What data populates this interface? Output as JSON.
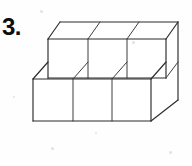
{
  "page": {
    "background_color": "#fefefe",
    "width": 192,
    "height": 166
  },
  "question": {
    "number_label": "3."
  },
  "figure": {
    "name": "cube-stack-figure",
    "line_color": "#2b2b2b",
    "face_color": "#ffffff",
    "cube_count_visible": 9,
    "rows": 2,
    "columns": 3,
    "projection": {
      "depth_dx": 14,
      "depth_dy": -17,
      "cube_width": 39,
      "cube_height": 40
    },
    "geometry": {
      "lower_front_left_x": 33,
      "lower_front_top_y": 79,
      "lower_front_bottom_y": 121,
      "lower_front_right_x": 151,
      "lower_dividers_x": [
        73,
        112
      ],
      "upper_front_left_x": 48,
      "upper_front_top_y": 39,
      "upper_front_bottom_y": 78,
      "upper_front_right_x": 166,
      "upper_dividers_x": [
        88,
        127
      ],
      "back_top_y": 22,
      "back_left_x": 60,
      "back_right_x": 178,
      "right_side_bottom_y": 100
    }
  },
  "artifacts": {
    "specks": [
      {
        "x": 41,
        "y": 11,
        "r": 1.6
      },
      {
        "x": 133,
        "y": 42,
        "r": 1.4
      },
      {
        "x": 52,
        "y": 148,
        "r": 1.5
      },
      {
        "x": 170,
        "y": 152,
        "r": 1.3
      },
      {
        "x": 14,
        "y": 97,
        "r": 1.2
      },
      {
        "x": 96,
        "y": 133,
        "r": 1.1
      }
    ]
  }
}
